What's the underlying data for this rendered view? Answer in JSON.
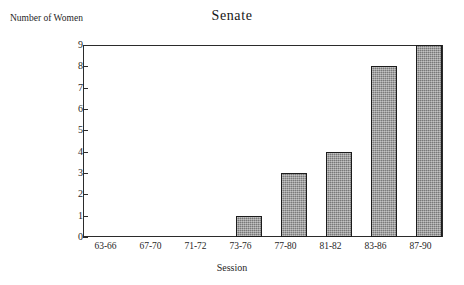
{
  "chart_data": {
    "type": "bar",
    "title": "Senate",
    "xlabel": "Session",
    "ylabel": "Number of Women",
    "categories": [
      "63-66",
      "67-70",
      "71-72",
      "73-76",
      "77-80",
      "81-82",
      "83-86",
      "87-90"
    ],
    "values": [
      0,
      0,
      0,
      1,
      3,
      4,
      8,
      9
    ],
    "ylim": [
      0,
      9
    ],
    "y_ticks": [
      0,
      1,
      2,
      3,
      4,
      5,
      6,
      7,
      8,
      9
    ],
    "y_tick_labels": [
      "0",
      "1",
      "2",
      "3",
      "4",
      "5",
      "6",
      "7",
      "8",
      "9"
    ],
    "grid": false,
    "legend": false,
    "bar_color": "#8a8a8a",
    "bar_edge_color": "#1c1c1c",
    "axis_color": "#2b2b2b",
    "background": "#ffffff"
  }
}
